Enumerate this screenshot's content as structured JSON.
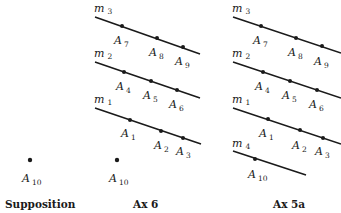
{
  "panels": [
    {
      "caption": "Supposition",
      "points": [
        {
          "name": "A",
          "sub": "10"
        }
      ]
    },
    {
      "caption": "Ax 6",
      "lines": [
        {
          "name": "m",
          "sub": "3",
          "points": [
            {
              "name": "A",
              "sub": "7"
            },
            {
              "name": "A",
              "sub": "8"
            },
            {
              "name": "A",
              "sub": "9"
            }
          ]
        },
        {
          "name": "m",
          "sub": "2",
          "points": [
            {
              "name": "A",
              "sub": "4"
            },
            {
              "name": "A",
              "sub": "5"
            },
            {
              "name": "A",
              "sub": "6"
            }
          ]
        },
        {
          "name": "m",
          "sub": "1",
          "points": [
            {
              "name": "A",
              "sub": "1"
            },
            {
              "name": "A",
              "sub": "2"
            },
            {
              "name": "A",
              "sub": "3"
            }
          ]
        }
      ],
      "points": [
        {
          "name": "A",
          "sub": "10"
        }
      ]
    },
    {
      "caption": "Ax 5a",
      "lines": [
        {
          "name": "m",
          "sub": "3",
          "points": [
            {
              "name": "A",
              "sub": "7"
            },
            {
              "name": "A",
              "sub": "8"
            },
            {
              "name": "A",
              "sub": "9"
            }
          ]
        },
        {
          "name": "m",
          "sub": "2",
          "points": [
            {
              "name": "A",
              "sub": "4"
            },
            {
              "name": "A",
              "sub": "5"
            },
            {
              "name": "A",
              "sub": "6"
            }
          ]
        },
        {
          "name": "m",
          "sub": "1",
          "points": [
            {
              "name": "A",
              "sub": "1"
            },
            {
              "name": "A",
              "sub": "2"
            },
            {
              "name": "A",
              "sub": "3"
            }
          ]
        },
        {
          "name": "m",
          "sub": "4",
          "points": [
            {
              "name": "A",
              "sub": "10"
            }
          ]
        }
      ]
    }
  ]
}
